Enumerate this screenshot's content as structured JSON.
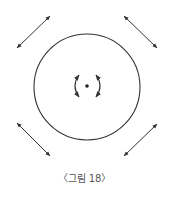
{
  "figure": {
    "caption": "〈그림 18〉",
    "stroke_color": "#333333",
    "elements": [
      {
        "type": "circle",
        "cx": 87,
        "cy": 87,
        "r": 53
      },
      {
        "type": "center-dot",
        "cx": 87,
        "cy": 86
      },
      {
        "type": "rotation-arrows",
        "direction": "around center"
      },
      {
        "type": "double-arrow",
        "position": "top-left"
      },
      {
        "type": "double-arrow",
        "position": "top-right"
      },
      {
        "type": "double-arrow",
        "position": "bottom-left"
      },
      {
        "type": "double-arrow",
        "position": "bottom-right"
      }
    ]
  }
}
